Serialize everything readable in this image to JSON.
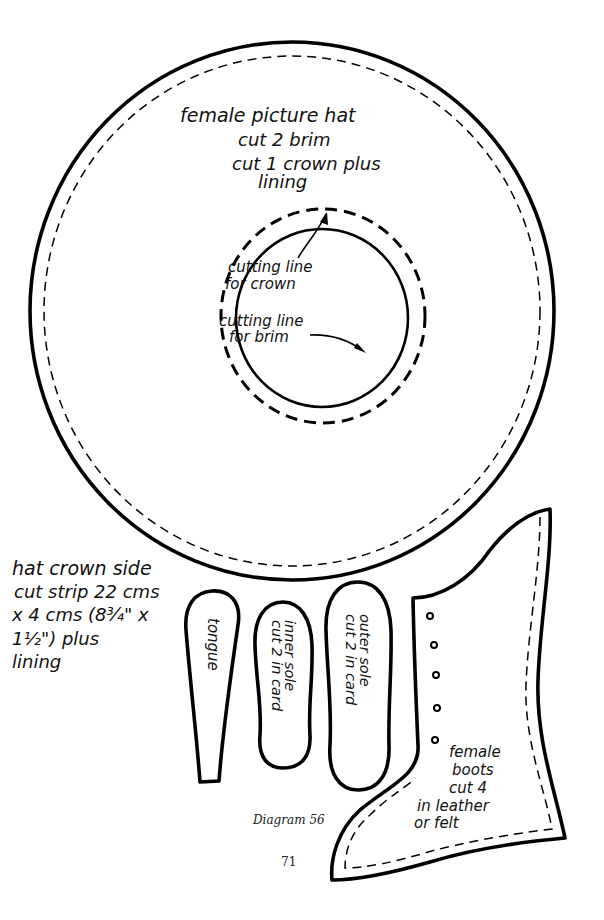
{
  "figure": {
    "caption": "Diagram 56",
    "page_number": "71"
  },
  "hat": {
    "label_lines": [
      "female picture hat",
      "cut 2 brim",
      "cut 1 crown plus",
      "lining"
    ],
    "crown_label_lines": [
      "cutting line",
      "for crown"
    ],
    "brim_label_lines": [
      "cutting line",
      "for brim"
    ]
  },
  "crown_side": {
    "label_lines": [
      "hat crown side",
      "cut strip 22 cms",
      "x 4 cms (8¾\" x",
      "1½\") plus",
      "lining"
    ]
  },
  "pieces": {
    "tongue": {
      "label": "tongue"
    },
    "inner_sole": {
      "label_lines": [
        "inner sole",
        "cut 2 in card"
      ]
    },
    "outer_sole": {
      "label_lines": [
        "outer sole",
        "cut 2 in card"
      ]
    }
  },
  "boot": {
    "label_lines": [
      "female",
      "boots",
      "cut 4",
      "in leather",
      "or felt"
    ],
    "eyelet_count": 5
  },
  "colors": {
    "ink": "#000000",
    "paper": "#ffffff"
  }
}
